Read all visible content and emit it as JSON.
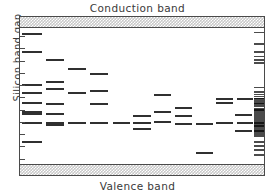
{
  "figure": {
    "top_label": "Conduction band",
    "bottom_label": "Valence band",
    "y_axis_label": "Silicon band gap"
  },
  "colors": {
    "level_line": "#303030",
    "band_fill": "#c8c8c8",
    "frame": "#4a4a4a",
    "text": "#3a3a3a",
    "background": "#ffffff"
  },
  "chart_data": {
    "type": "scatter",
    "subtitle": "",
    "xlabel": "",
    "ylabel": "Silicon band gap",
    "top_band_label": "Conduction band",
    "bottom_band_label": "Valence band",
    "xlim": [
      0,
      100
    ],
    "ylim": [
      0,
      100
    ],
    "grid": false,
    "legend_position": "none",
    "y_axis_ticks": [
      4,
      13,
      22,
      31,
      40,
      49,
      58,
      67,
      76,
      85,
      94
    ],
    "columns": [
      {
        "name": "col-1",
        "x_start": 1.0,
        "x_end": 9.0,
        "values": [
          95.5,
          82.0,
          58.0,
          52.0,
          45.0,
          38.5,
          36.5,
          30.5,
          16.0
        ]
      },
      {
        "name": "col-2",
        "x_start": 10.5,
        "x_end": 18.0,
        "values": [
          76.5,
          60.5,
          55.0,
          44.0,
          37.0,
          30.5,
          29.0
        ]
      },
      {
        "name": "col-3",
        "x_start": 19.5,
        "x_end": 27.0,
        "values": [
          70.0,
          52.0,
          30.5
        ]
      },
      {
        "name": "col-4",
        "x_start": 28.5,
        "x_end": 36.0,
        "values": [
          66.5,
          53.5,
          44.0,
          30.5
        ]
      },
      {
        "name": "col-5",
        "x_start": 38.0,
        "x_end": 45.0,
        "values": [
          30.0
        ]
      },
      {
        "name": "col-6",
        "x_start": 46.5,
        "x_end": 53.5,
        "values": [
          35.5,
          30.5,
          25.5
        ]
      },
      {
        "name": "col-7",
        "x_start": 55.0,
        "x_end": 62.0,
        "values": [
          51.0,
          38.0,
          31.0
        ]
      },
      {
        "name": "col-8",
        "x_start": 63.5,
        "x_end": 70.5,
        "values": [
          41.5,
          35.0,
          29.5
        ]
      },
      {
        "name": "col-9",
        "x_start": 72.0,
        "x_end": 79.0,
        "values": [
          29.5
        ]
      },
      {
        "name": "col-10",
        "x_start": 80.5,
        "x_end": 87.5,
        "values": [
          47.5,
          45.0,
          30.5
        ]
      },
      {
        "name": "col-11",
        "x_start": 89.0,
        "x_end": 95.5,
        "values": [
          47.5,
          30.5
        ]
      },
      {
        "name": "col-12",
        "x_start": 72.0,
        "x_end": 79.0,
        "values": [
          8.0
        ]
      },
      {
        "name": "col-13",
        "x_start": 88.0,
        "x_end": 95.0,
        "values": [
          36.0,
          24.5
        ]
      }
    ],
    "dense_continuum": {
      "x_start": 96.0,
      "x_end": 100.0,
      "values": [
        96.5,
        88.0,
        82.0,
        79.0,
        76.5,
        74.0,
        56.0,
        53.0,
        51.0,
        49.5,
        48.0,
        46.8,
        45.6,
        44.4,
        43.2,
        42.0,
        40.8,
        39.6,
        38.4,
        37.2,
        36.0,
        34.8,
        33.6,
        32.4,
        31.2,
        30.0,
        28.8,
        27.6,
        26.4,
        25.2,
        24.0,
        22.8,
        21.6,
        20.4,
        16.0,
        13.0,
        10.0,
        6.5
      ],
      "heavy_values": [
        48.0,
        44.4,
        39.6,
        30.0,
        27.6,
        24.0
      ]
    }
  }
}
